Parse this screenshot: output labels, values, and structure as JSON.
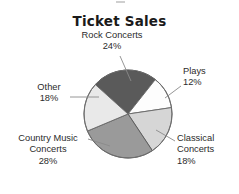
{
  "chart_data": {
    "type": "pie",
    "title": "Ticket Sales",
    "xlabel": "",
    "ylabel": "",
    "units": "percent",
    "legend_position": "none",
    "grid": false,
    "label_format": "name + percent outside with leader lines",
    "start_angle_deg": -48,
    "direction": "clockwise",
    "categories": [
      "Rock Concerts",
      "Plays",
      "Classical Concerts",
      "Country Music Concerts",
      "Other"
    ],
    "values": [
      24,
      12,
      18,
      28,
      18
    ],
    "total": 100,
    "slices": [
      {
        "name": "Rock Concerts",
        "label_line1": "Rock Concerts",
        "label_line2": "24%",
        "value": 24,
        "percent_text": "24%",
        "color": "#5a5a5a",
        "stroke": "#3f3f3f"
      },
      {
        "name": "Plays",
        "label_line1": "Plays",
        "label_line2": "12%",
        "value": 12,
        "percent_text": "12%",
        "color": "#fdfdfd",
        "stroke": "#6e6e6e"
      },
      {
        "name": "Classical Concerts",
        "label_line1": "Classical",
        "label_line2": "Concerts",
        "label_line3": "18%",
        "value": 18,
        "percent_text": "18%",
        "color": "#d6d6d6",
        "stroke": "#6e6e6e"
      },
      {
        "name": "Country Music Concerts",
        "label_line1": "Country Music",
        "label_line2": "Concerts",
        "label_line3": "28%",
        "value": 28,
        "percent_text": "28%",
        "color": "#9a9a9a",
        "stroke": "#5e5e5e"
      },
      {
        "name": "Other",
        "label_line1": "Other",
        "label_line2": "18%",
        "value": 18,
        "percent_text": "18%",
        "color": "#e9e9e9",
        "stroke": "#6e6e6e"
      }
    ]
  },
  "figure": {
    "background": "#ffffff",
    "title_color": "#1a1a1a",
    "label_color": "#2b2b2b",
    "leader_color": "#808080",
    "center_x": 128,
    "center_y": 114,
    "radius": 44
  }
}
